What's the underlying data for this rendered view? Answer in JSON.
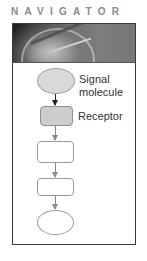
{
  "header": {
    "title": "NAVIGATOR"
  },
  "banner": {
    "icon": "compass-icon"
  },
  "diagram": {
    "nodes": [
      {
        "id": "signal-molecule",
        "shape": "ellipse",
        "filled": true,
        "label_line1": "Signal",
        "label_line2": "molecule"
      },
      {
        "id": "receptor",
        "shape": "rounded-rect",
        "filled": true,
        "label": "Receptor"
      },
      {
        "id": "step-3",
        "shape": "rounded-rect",
        "filled": false,
        "label": ""
      },
      {
        "id": "step-4",
        "shape": "rounded-rect",
        "filled": false,
        "label": ""
      },
      {
        "id": "response",
        "shape": "ellipse",
        "filled": false,
        "label": ""
      }
    ],
    "edges": [
      {
        "from": "signal-molecule",
        "to": "receptor",
        "style": "dark"
      },
      {
        "from": "receptor",
        "to": "step-3",
        "style": "light"
      },
      {
        "from": "step-3",
        "to": "step-4",
        "style": "light"
      },
      {
        "from": "step-4",
        "to": "response",
        "style": "light"
      }
    ]
  },
  "colors": {
    "frame_border": "#3a3a3a",
    "title": "#8a8a8a",
    "filled_shape": "#d9d9d9",
    "outline": "#9a9a9a"
  }
}
